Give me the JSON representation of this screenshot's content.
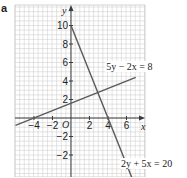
{
  "part_label": "a",
  "chart_data": {
    "type": "line",
    "title": "",
    "xlabel": "x",
    "ylabel": "y",
    "origin_label": "O",
    "xlim": [
      -6,
      7
    ],
    "ylim": [
      -6,
      12
    ],
    "grid": true,
    "x_ticks": [
      -4,
      -2,
      2,
      4,
      6
    ],
    "x_tick_labels": [
      "−4",
      "−2",
      "2",
      "4",
      "6"
    ],
    "y_ticks": [
      10,
      8,
      6,
      4,
      2,
      -2,
      -4
    ],
    "y_tick_labels": [
      "10",
      "8",
      "6",
      "4",
      "2",
      "−2",
      "−2"
    ],
    "series": [
      {
        "name": "5y − 2x = 8",
        "equation": "y = (8 + 2x)/5",
        "points": [
          [
            -6,
            -0.8
          ],
          [
            7,
            4.4
          ]
        ],
        "label_pos": [
          3.8,
          5.2
        ]
      },
      {
        "name": "2y + 5x = 20",
        "equation": "y = (20 - 5x)/2",
        "points": [
          [
            0,
            10
          ],
          [
            6.8,
            -7
          ]
        ],
        "label_pos": [
          5.4,
          -5.3
        ]
      }
    ],
    "colors": {
      "grid": "#c8c8c8",
      "axis": "#3a3a3a",
      "line": "#5a5a5a",
      "text": "#222222"
    }
  }
}
